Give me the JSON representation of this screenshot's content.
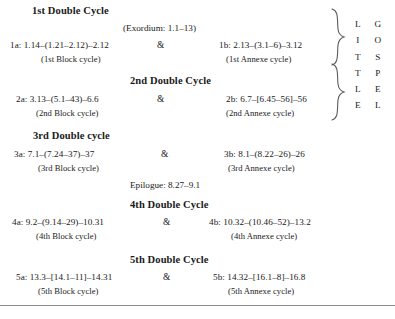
{
  "figure": {
    "aside_top": "(Exordium: 1.1–13)",
    "aside_middle": "Epilogue: 8.27–9.1",
    "ampersand": "&",
    "brace_color": "#4a4a4a",
    "rule_color": "#8d8d8d",
    "text_color": "#1a1a1a"
  },
  "letters": {
    "little": [
      "L",
      "I",
      "T",
      "T",
      "L",
      "E"
    ],
    "gospel": [
      "G",
      "O",
      "S",
      "P",
      "E",
      "L"
    ]
  },
  "cycles": [
    {
      "title": "1st Double Cycle",
      "left": {
        "ref": "1a: 1.14–(1.21–2.12)–2.12",
        "label": "(1st Block cycle)"
      },
      "right": {
        "ref": "1b: 2.13–(3.1–6)–3.12",
        "label": "(1st Annexe cycle)"
      }
    },
    {
      "title": "2nd Double Cycle",
      "left": {
        "ref": "2a: 3.13–(5.1–43)–6.6",
        "label": "(2nd Block cycle)"
      },
      "right": {
        "ref": "2b: 6.7–[6.45–56]–56",
        "label": "(2nd Annexe cycle)"
      }
    },
    {
      "title": "3rd Double cycle",
      "left": {
        "ref": "3a: 7.1–(7.24–37)–37",
        "label": "(3rd Block cycle)"
      },
      "right": {
        "ref": "3b: 8.1–(8.22–26)–26",
        "label": "(3rd Annexe cycle)"
      }
    },
    {
      "title": "4th Double Cycle",
      "left": {
        "ref": "4a: 9.2–(9.14–29)–10.31",
        "label": "(4th Block cycle)"
      },
      "right": {
        "ref": "4b: 10.32–(10.46–52)–13.2",
        "label": "(4th Annexe cycle)"
      }
    },
    {
      "title": "5th Double Cycle",
      "left": {
        "ref": "5a: 13.3–[14.1–11]–14.31",
        "label": "(5th Block cycle)"
      },
      "right": {
        "ref": "5b: 14.32–[16.1–8]–16.8",
        "label": "(5th Annexe cycle)"
      }
    }
  ]
}
